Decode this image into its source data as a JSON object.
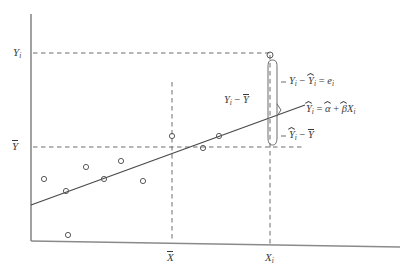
{
  "figure": {
    "type": "scatter-with-regression-line",
    "background_color": "#ffffff",
    "ink_color": "#3b3b3b"
  },
  "axes": {
    "y_axis": {
      "name": "y-axis",
      "x": 31,
      "y_top": 14,
      "y_bottom": 241
    },
    "x_axis": {
      "name": "x-axis",
      "x_left": 31,
      "y_left": 241,
      "x_right": 400,
      "y_right": 247
    },
    "y_ticks": [
      {
        "label": "Y",
        "subscript": "i",
        "accent": "none",
        "value_y": 53
      },
      {
        "label": "Y",
        "subscript": "",
        "accent": "bar",
        "value_y": 147
      }
    ],
    "x_ticks": [
      {
        "label": "X",
        "subscript": "",
        "accent": "bar",
        "value_x": 172
      },
      {
        "label": "X",
        "subscript": "i",
        "accent": "none",
        "value_x": 270
      }
    ]
  },
  "guides": {
    "horizontal_dashed": [
      {
        "name": "yi-guide",
        "y": 53,
        "x_from": 33,
        "x_to": 272
      },
      {
        "name": "ybar-guide",
        "y": 147,
        "x_from": 33,
        "x_to": 305
      }
    ],
    "vertical_dashed": [
      {
        "name": "xbar-guide",
        "x": 172,
        "y_from": 82,
        "y_to": 241
      },
      {
        "name": "xi-guide",
        "x": 270,
        "y_from": 55,
        "y_to": 245
      }
    ]
  },
  "regression_line": {
    "name": "fitted-regression-line",
    "x1": 31,
    "y1": 205,
    "x2": 305,
    "y2": 105,
    "equation": "Y = a + bX"
  },
  "scatter_points": [
    {
      "x": 44,
      "y": 179
    },
    {
      "x": 66,
      "y": 191
    },
    {
      "x": 86,
      "y": 167
    },
    {
      "x": 104,
      "y": 179
    },
    {
      "x": 68,
      "y": 235
    },
    {
      "x": 121,
      "y": 161
    },
    {
      "x": 143,
      "y": 181
    },
    {
      "x": 172,
      "y": 136
    },
    {
      "x": 203,
      "y": 148
    },
    {
      "x": 219,
      "y": 136
    },
    {
      "x": 270,
      "y": 55
    }
  ],
  "highlighted_point": {
    "name": "observation-i",
    "x": 270,
    "y": 55
  },
  "brace": {
    "name": "deviation-brace",
    "x": 277,
    "y_top": 55,
    "y_bottom": 147,
    "split_y": 110
  },
  "annotations": [
    {
      "id": "residual",
      "name": "residual-label",
      "x": 289,
      "y": 82,
      "parts": [
        {
          "text": "Y",
          "style": "italic",
          "accent": "none",
          "sub": "i"
        },
        {
          "text": " − ",
          "style": "op"
        },
        {
          "text": "Y",
          "style": "italic",
          "accent": "hat",
          "sub": "i"
        },
        {
          "text": " = ",
          "style": "op"
        },
        {
          "text": "e",
          "style": "italic",
          "accent": "none",
          "sub": "i"
        }
      ],
      "plain": "Yi − Ŷi = ei"
    },
    {
      "id": "total-deviation",
      "name": "total-deviation-label",
      "x": 224,
      "y": 101,
      "parts": [
        {
          "text": "Y",
          "style": "italic",
          "accent": "none",
          "sub": "i"
        },
        {
          "text": " − ",
          "style": "op"
        },
        {
          "text": "Y",
          "style": "italic",
          "accent": "bar",
          "sub": ""
        }
      ],
      "plain": "Yi − Ȳ"
    },
    {
      "id": "fitted-equation",
      "name": "fitted-equation-label",
      "x": 306,
      "y": 110,
      "parts": [
        {
          "text": "Y",
          "style": "italic",
          "accent": "hat",
          "sub": "i"
        },
        {
          "text": " = ",
          "style": "op"
        },
        {
          "text": "α",
          "style": "italic",
          "accent": "hat",
          "sub": ""
        },
        {
          "text": " + ",
          "style": "op"
        },
        {
          "text": "β",
          "style": "italic",
          "accent": "hat",
          "sub": ""
        },
        {
          "text": "X",
          "style": "italic",
          "accent": "none",
          "sub": "i"
        }
      ],
      "plain": "Ŷi = α̂ + β̂Xi"
    },
    {
      "id": "explained-deviation",
      "name": "explained-deviation-label",
      "x": 289,
      "y": 136,
      "parts": [
        {
          "text": "Y",
          "style": "italic",
          "accent": "hat",
          "sub": "i"
        },
        {
          "text": " − ",
          "style": "op"
        },
        {
          "text": "Y",
          "style": "italic",
          "accent": "bar",
          "sub": ""
        }
      ],
      "plain": "Ŷi − Ȳ"
    }
  ]
}
